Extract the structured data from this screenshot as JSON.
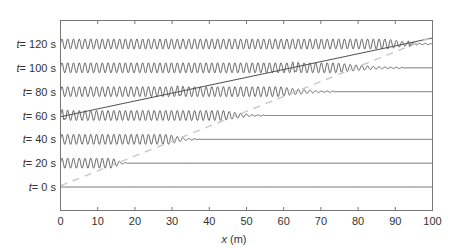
{
  "chart_data": {
    "type": "line",
    "title": "",
    "xlabel_var": "x",
    "xlabel_unit": " (m)",
    "ylabel": "",
    "xlim": [
      0,
      100
    ],
    "xticks": [
      0,
      10,
      20,
      30,
      40,
      50,
      60,
      70,
      80,
      90,
      100
    ],
    "grid": false,
    "legend": null,
    "rows": [
      {
        "label_var": "t",
        "label_value": "= 0 s",
        "t": 0,
        "full_amp_until": 0,
        "tail_until": 0
      },
      {
        "label_var": "t",
        "label_value": "= 20 s",
        "t": 20,
        "full_amp_until": 14,
        "tail_until": 18
      },
      {
        "label_var": "t",
        "label_value": "= 40 s",
        "t": 40,
        "full_amp_until": 29,
        "tail_until": 37
      },
      {
        "label_var": "t",
        "label_value": "= 60 s",
        "t": 60,
        "full_amp_until": 44,
        "tail_until": 55
      },
      {
        "label_var": "t",
        "label_value": "= 80 s",
        "t": 80,
        "full_amp_until": 59,
        "tail_until": 74
      },
      {
        "label_var": "t",
        "label_value": "= 100 s",
        "t": 100,
        "full_amp_until": 74,
        "tail_until": 93
      },
      {
        "label_var": "t",
        "label_value": "= 120 s",
        "t": 120,
        "full_amp_until": 88,
        "tail_until": 100
      }
    ],
    "wave": {
      "wavelength_m": 1.55,
      "amplitude_px": 5
    },
    "packet_bursts": [
      {
        "t": 60,
        "x": 1
      },
      {
        "t": 80,
        "x": 32
      },
      {
        "t": 100,
        "x": 63
      },
      {
        "t": 120,
        "x": 94
      }
    ],
    "lines": [
      {
        "name": "solid-packet-trajectory",
        "style": "solid",
        "color": "#555555",
        "from": {
          "x": 0,
          "t": 59
        },
        "to": {
          "x": 100,
          "t": 125
        }
      },
      {
        "name": "dashed-front-trajectory",
        "style": "dashed",
        "color": "#c8c8c8",
        "from": {
          "x": 0,
          "t": 1
        },
        "to": {
          "x": 100,
          "t": 126
        }
      }
    ],
    "colors": {
      "trace": "#555555",
      "axes": "#777777",
      "dashed": "#c8c8c8"
    }
  }
}
